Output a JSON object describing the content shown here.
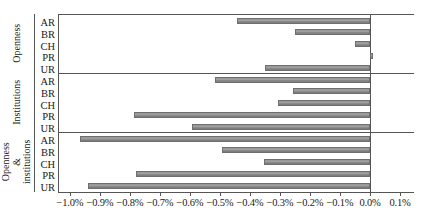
{
  "chart_data": {
    "type": "bar",
    "orientation": "horizontal",
    "title": "",
    "subtitle": "",
    "xlabel": "",
    "ylabel": "",
    "xlim": [
      -1.05,
      0.12
    ],
    "xunit": "%",
    "grid": false,
    "legend": null,
    "xticks": [
      -1.0,
      -0.9,
      -0.8,
      -0.7,
      -0.6,
      -0.5,
      -0.4,
      -0.3,
      -0.2,
      -0.1,
      0.0,
      0.1
    ],
    "xticklabels": [
      "−1.0%",
      "−0.9%",
      "−0.8%",
      "−0.7%",
      "−0.6%",
      "−0.5%",
      "−0.4%",
      "−0.3%",
      "−0.2%",
      "−0.1%",
      "0.0%",
      "0.1%"
    ],
    "categories": [
      "AR",
      "BR",
      "CH",
      "PR",
      "UR"
    ],
    "groups": [
      {
        "name": "Openness",
        "label_lines": [
          "Openness"
        ],
        "values": [
          -0.443,
          -0.25,
          -0.05,
          0.01,
          -0.35
        ]
      },
      {
        "name": "Institutions",
        "label_lines": [
          "Institutions"
        ],
        "values": [
          -0.517,
          -0.257,
          -0.307,
          -0.787,
          -0.593
        ]
      },
      {
        "name": "Openness & institutions",
        "label_lines": [
          "Openness &",
          "institutions"
        ],
        "values": [
          -0.967,
          -0.493,
          -0.353,
          -0.78,
          -0.94
        ]
      }
    ],
    "colors": {
      "bar_fill": "#999999",
      "bar_edge": "#6f6f6f",
      "axis": "#555555",
      "text": "#1a1a1a",
      "background": "#ffffff"
    }
  }
}
